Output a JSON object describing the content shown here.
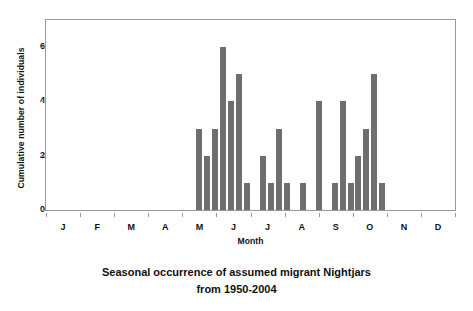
{
  "chart_data": {
    "type": "bar",
    "title": "Seasonal occurrence of assumed migrant Nightjars from 1950-2004",
    "title_line1": "Seasonal occurrence of assumed migrant Nightjars",
    "title_line2": "from 1950-2004",
    "xlabel": "Month",
    "ylabel": "Cumulative number of individuals",
    "ylim": [
      0,
      7
    ],
    "yticks": [
      0,
      2,
      4,
      6
    ],
    "ytick_labels": [
      "0",
      "2",
      "4",
      "6"
    ],
    "grid": false,
    "legend": false,
    "bar_color": "#6e6e6e",
    "axis_color": "#9a9a9a",
    "xtick_categories": [
      "J",
      "F",
      "M",
      "A",
      "M",
      "J",
      "J",
      "A",
      "S",
      "O",
      "N",
      "D"
    ],
    "x_axis_note": "Horizontal axis is continuous across the year; month letters are placed at month centres. Bars are individual records placed within the year.",
    "bars": [
      {
        "x_frac": 0.374,
        "value": 3
      },
      {
        "x_frac": 0.3935,
        "value": 2
      },
      {
        "x_frac": 0.413,
        "value": 3
      },
      {
        "x_frac": 0.4325,
        "value": 6
      },
      {
        "x_frac": 0.452,
        "value": 4
      },
      {
        "x_frac": 0.4715,
        "value": 5
      },
      {
        "x_frac": 0.491,
        "value": 1
      },
      {
        "x_frac": 0.53,
        "value": 2
      },
      {
        "x_frac": 0.5495,
        "value": 1
      },
      {
        "x_frac": 0.569,
        "value": 3
      },
      {
        "x_frac": 0.5885,
        "value": 1
      },
      {
        "x_frac": 0.6275,
        "value": 1
      },
      {
        "x_frac": 0.6665,
        "value": 4
      },
      {
        "x_frac": 0.7055,
        "value": 1
      },
      {
        "x_frac": 0.725,
        "value": 4
      },
      {
        "x_frac": 0.7445,
        "value": 1
      },
      {
        "x_frac": 0.764,
        "value": 2
      },
      {
        "x_frac": 0.7835,
        "value": 3
      },
      {
        "x_frac": 0.803,
        "value": 5
      },
      {
        "x_frac": 0.8225,
        "value": 1
      }
    ],
    "values": [
      3,
      2,
      3,
      6,
      4,
      5,
      1,
      2,
      1,
      3,
      1,
      1,
      4,
      1,
      4,
      1,
      2,
      3,
      5,
      1
    ],
    "monthly_totals": {
      "J": 0,
      "F": 0,
      "M": 0,
      "A": 3,
      "M2": 21,
      "J2": 6,
      "J3": 2,
      "A2": 5,
      "S": 11,
      "O": 0,
      "N": 0,
      "D": 0
    }
  }
}
